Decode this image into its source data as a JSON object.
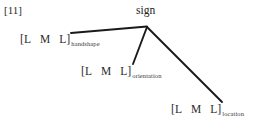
{
  "figure": {
    "example_number": "[11]",
    "background_color": "#ffffff",
    "line_color": "#1a1a1a",
    "text_color": "#222222",
    "width": 261,
    "height": 123
  },
  "tree": {
    "root": {
      "label": "sign",
      "x": 147,
      "y": 27
    },
    "branches": [
      {
        "name": "handshape-branch",
        "x1": 147,
        "y1": 26,
        "x2": 71,
        "y2": 33
      },
      {
        "name": "orientation-branch",
        "x1": 147,
        "y1": 27,
        "x2": 133,
        "y2": 64
      },
      {
        "name": "location-branch",
        "x1": 147,
        "y1": 27,
        "x2": 222,
        "y2": 102
      }
    ],
    "tiers": [
      {
        "name": "handshape",
        "open_bracket": "[",
        "segments": [
          "L",
          "M",
          "L"
        ],
        "close_bracket": "]",
        "subscript": "handshape"
      },
      {
        "name": "orientation",
        "open_bracket": "[",
        "segments": [
          "L",
          "M",
          "L"
        ],
        "close_bracket": "]",
        "subscript": "orientation"
      },
      {
        "name": "location",
        "open_bracket": "[",
        "segments": [
          "L",
          "M",
          "L"
        ],
        "close_bracket": "]",
        "subscript": "location"
      }
    ]
  }
}
